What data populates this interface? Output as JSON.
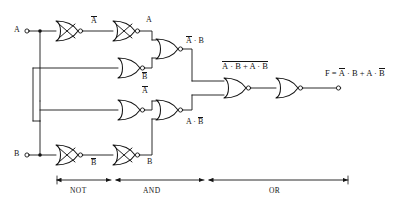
{
  "diagram": {
    "inputs": [
      {
        "name": "input-a",
        "label": "A"
      },
      {
        "name": "input-b",
        "label": "B"
      }
    ],
    "output": {
      "name": "output-f",
      "expression_prefix": "F = ",
      "term1_bar": "A",
      "term1_rest": " · B + A · ",
      "term2_bar": "B",
      "full": "F = Ā · B + A · B̄"
    },
    "wire_labels": [
      {
        "name": "label-a-bar-top",
        "bar": "A",
        "rest": ""
      },
      {
        "name": "label-a-top",
        "bar": "",
        "rest": "A"
      },
      {
        "name": "label-b-bar-mid",
        "bar": "B",
        "rest": ""
      },
      {
        "name": "label-a-bar-mid",
        "bar": "A",
        "rest": ""
      },
      {
        "name": "label-b-bar-bot",
        "bar": "B",
        "rest": ""
      },
      {
        "name": "label-b-bot",
        "bar": "",
        "rest": "B"
      }
    ],
    "gate_output_labels": [
      {
        "name": "label-nand-top",
        "bar": "A",
        "rest": " · B"
      },
      {
        "name": "label-nand-bottom",
        "bar": "",
        "pre": "A · ",
        "bar2": "B"
      },
      {
        "name": "label-nor-mid",
        "text": "A · B + A · B"
      }
    ],
    "mid_expression": {
      "bar_all": "A · B + A · B",
      "seg_a": "A",
      "seg_mid": " · B + A · ",
      "seg_b": "B"
    },
    "stages": [
      {
        "name": "stage-not",
        "label": "NOT"
      },
      {
        "name": "stage-and",
        "label": "AND"
      },
      {
        "name": "stage-or",
        "label": "OR"
      }
    ],
    "colors": {
      "ink": "#141414",
      "background": "#ffffff"
    }
  }
}
